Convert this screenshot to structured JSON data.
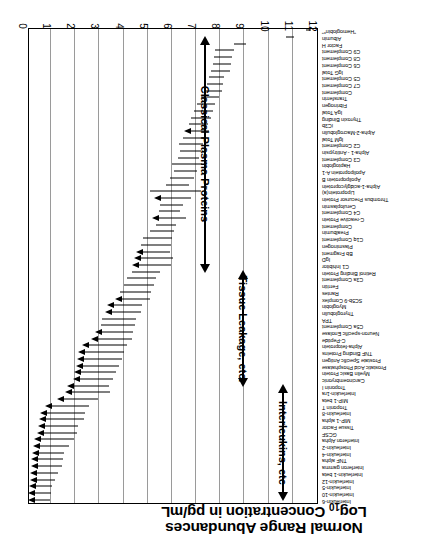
{
  "chart_data": {
    "type": "bar",
    "orientation": "horizontal-range",
    "title": "Normal Range Abundances",
    "title_line1": "Normal Range Abundances",
    "title_line2_pre": "Log",
    "title_line2_sub": "10",
    "title_line2_post": " Concentration in pg/mL",
    "xlabel": "Log10 Concentration in pg/mL",
    "ylabel": "",
    "xlim": [
      0,
      12
    ],
    "xticks": [
      0,
      1,
      2,
      3,
      4,
      5,
      6,
      7,
      8,
      9,
      10,
      11,
      12
    ],
    "xtick_labels": [
      "0",
      "1",
      "2",
      "3",
      "4",
      "5",
      "6",
      "7",
      "8",
      "9",
      "10",
      "11",
      "12"
    ],
    "grid": "vertical gridlines at every integer log unit",
    "legend": "none",
    "axis_note": "axis increases right-to-left in the printed (rotated) figure",
    "annotations": [
      {
        "label": "Interleukins, etc",
        "span_log10": [
          0.3,
          2.2
        ],
        "arrow": "double-headed"
      },
      {
        "label": "Tissue Leakage, etc.",
        "span_log10": [
          2.2,
          5.6
        ],
        "arrow": "double-headed"
      },
      {
        "label": "Classical Plasma Proteins",
        "span_log10": [
          5.6,
          11.6
        ],
        "arrow": "double-headed"
      }
    ],
    "value_unit": "log10 pg/mL",
    "series_description": "Each row is the normal plasma concentration range (low to high) of one protein; arrowheads mark the low-abundance end.",
    "rows": [
      {
        "name": "Interleukin-6",
        "low": 0.1,
        "high": 0.95,
        "arrow": true
      },
      {
        "name": "Interleukin-10",
        "low": 0.1,
        "high": 1.0,
        "arrow": true
      },
      {
        "name": "Interleukin-5",
        "low": 0.12,
        "high": 1.05,
        "arrow": true
      },
      {
        "name": "Interleukin-12",
        "low": 0.15,
        "high": 1.15,
        "arrow": true
      },
      {
        "name": "Interleukin-1 beta",
        "low": 0.18,
        "high": 1.3,
        "arrow": true
      },
      {
        "name": "Interferon gamma",
        "low": 0.2,
        "high": 1.45,
        "arrow": true
      },
      {
        "name": "TNF alpha",
        "low": 0.22,
        "high": 1.5,
        "arrow": true
      },
      {
        "name": "Interleukin-4",
        "low": 0.25,
        "high": 1.55,
        "arrow": true
      },
      {
        "name": "Interleukin-2",
        "low": 0.3,
        "high": 1.75,
        "arrow": true
      },
      {
        "name": "Interferon Alpha",
        "low": 0.35,
        "high": 1.95,
        "arrow": true
      },
      {
        "name": "GCSF",
        "low": 0.45,
        "high": 2.05,
        "arrow": true
      },
      {
        "name": "Tissue Factor",
        "low": 0.5,
        "high": 2.1,
        "arrow": true
      },
      {
        "name": "MIP-1 alpha",
        "low": 0.55,
        "high": 2.35,
        "arrow": true
      },
      {
        "name": "Interleukin-8",
        "low": 0.6,
        "high": 2.4,
        "arrow": true
      },
      {
        "name": "Troponin T",
        "low": 0.8,
        "high": 2.55,
        "arrow": true
      },
      {
        "name": "MIP-1 beta",
        "low": 1.3,
        "high": 2.95,
        "arrow": true
      },
      {
        "name": "Interleukin-1ra",
        "low": 1.6,
        "high": 3.45,
        "arrow": true
      },
      {
        "name": "Troponin I",
        "low": 1.7,
        "high": 3.4,
        "arrow": true
      },
      {
        "name": "Carcinoembryonic",
        "low": 1.95,
        "high": 3.55,
        "arrow": true
      },
      {
        "name": "Myelin Basic Protein",
        "low": 2.0,
        "high": 3.7,
        "arrow": true
      },
      {
        "name": "Prostatic Acid Phosphatase",
        "low": 2.05,
        "high": 3.8,
        "arrow": true
      },
      {
        "name": "Prostate Specific Antigen",
        "low": 2.1,
        "high": 3.95,
        "arrow": true
      },
      {
        "name": "TNF Binding Proteins",
        "low": 2.15,
        "high": 4.0,
        "arrow": true
      },
      {
        "name": "Alpha-fetoprotein",
        "low": 2.3,
        "high": 4.15,
        "arrow": true
      },
      {
        "name": "C-Peptide",
        "low": 2.7,
        "high": 4.35,
        "arrow": true
      },
      {
        "name": "Neuron-specific Enolase",
        "low": 2.85,
        "high": 4.4,
        "arrow": true
      },
      {
        "name": "C5a Complement",
        "low": 3.05,
        "high": 4.45,
        "arrow": false
      },
      {
        "name": "TPA",
        "low": 3.1,
        "high": 4.5,
        "arrow": false
      },
      {
        "name": "Thyroglobulin",
        "low": 3.25,
        "high": 4.7,
        "arrow": true
      },
      {
        "name": "Myoglobin",
        "low": 3.35,
        "high": 4.75,
        "arrow": true
      },
      {
        "name": "SC5b-9 Complex",
        "low": 3.7,
        "high": 5.1,
        "arrow": true
      },
      {
        "name": "Rantes",
        "low": 3.85,
        "high": 5.15,
        "arrow": false
      },
      {
        "name": "Ferritin",
        "low": 4.0,
        "high": 5.25,
        "arrow": false
      },
      {
        "name": "C3a Complement",
        "low": 4.15,
        "high": 5.35,
        "arrow": false
      },
      {
        "name": "Retinol Binding Protein",
        "low": 4.35,
        "high": 5.5,
        "arrow": false
      },
      {
        "name": "C1 Inhibitor",
        "low": 4.4,
        "high": 5.95,
        "arrow": true
      },
      {
        "name": "IgD",
        "low": 4.45,
        "high": 6.05,
        "arrow": true
      },
      {
        "name": "Bb Fragment",
        "low": 4.55,
        "high": 5.9,
        "arrow": true
      },
      {
        "name": "Plasminogen",
        "low": 4.7,
        "high": 5.95,
        "arrow": false
      },
      {
        "name": "C1q Complement",
        "low": 4.8,
        "high": 6.0,
        "arrow": false
      },
      {
        "name": "Prealbumin",
        "low": 5.1,
        "high": 6.1,
        "arrow": false
      },
      {
        "name": "Complement",
        "low": 5.35,
        "high": 6.15,
        "arrow": false
      },
      {
        "name": "C-reactive Protein",
        "low": 5.2,
        "high": 6.6,
        "arrow": true
      },
      {
        "name": "C4 Complement",
        "low": 5.45,
        "high": 6.35,
        "arrow": false
      },
      {
        "name": "Ceruloplasmin",
        "low": 5.5,
        "high": 6.45,
        "arrow": false
      },
      {
        "name": "Thrombus Precursor Protein",
        "low": 5.3,
        "high": 6.8,
        "arrow": true
      },
      {
        "name": "Lipoprotein(a)",
        "low": 5.1,
        "high": 7.2,
        "arrow": false
      },
      {
        "name": "Alpha-1-acidglycoprotein",
        "low": 5.75,
        "high": 6.7,
        "arrow": false
      },
      {
        "name": "Apolipoprotein B",
        "low": 5.9,
        "high": 6.9,
        "arrow": false
      },
      {
        "name": "Apolipoprotein A-1",
        "low": 6.1,
        "high": 7.05,
        "arrow": false
      },
      {
        "name": "Haptoglobin",
        "low": 6.0,
        "high": 7.25,
        "arrow": false
      },
      {
        "name": "C3 Complement",
        "low": 6.25,
        "high": 7.1,
        "arrow": false
      },
      {
        "name": "Alpha-1 - Antitrypsin",
        "low": 6.35,
        "high": 7.2,
        "arrow": false
      },
      {
        "name": "C2 Complement",
        "low": 6.3,
        "high": 7.3,
        "arrow": false
      },
      {
        "name": "IgM Total",
        "low": 6.45,
        "high": 7.4,
        "arrow": false
      },
      {
        "name": "Alpha-2-Macroglobulin",
        "low": 6.55,
        "high": 7.55,
        "arrow": true
      },
      {
        "name": "iC3b",
        "low": 6.7,
        "high": 7.5,
        "arrow": false
      },
      {
        "name": "Thyroxin Binding",
        "low": 6.8,
        "high": 7.6,
        "arrow": false
      },
      {
        "name": "IgA Total",
        "low": 6.9,
        "high": 7.7,
        "arrow": false
      },
      {
        "name": "Fibrinogen",
        "low": 7.05,
        "high": 7.8,
        "arrow": false
      },
      {
        "name": "Transferrin",
        "low": 7.2,
        "high": 7.95,
        "arrow": false
      },
      {
        "name": "Complement",
        "low": 7.35,
        "high": 8.05,
        "arrow": false
      },
      {
        "name": "C7 Complement",
        "low": 7.45,
        "high": 8.1,
        "arrow": false
      },
      {
        "name": "C5 Complement",
        "low": 7.55,
        "high": 8.15,
        "arrow": false
      },
      {
        "name": "IgG Total",
        "low": 7.6,
        "high": 8.4,
        "arrow": false
      },
      {
        "name": "C6 Complement",
        "low": 7.7,
        "high": 8.45,
        "arrow": false
      },
      {
        "name": "C8 Complement",
        "low": 7.75,
        "high": 8.5,
        "arrow": false
      },
      {
        "name": "C9 Complement",
        "low": 7.8,
        "high": 8.55,
        "arrow": false
      },
      {
        "name": "Factor H",
        "low": 8.55,
        "high": 9.05,
        "arrow": false
      },
      {
        "name": "Albumin",
        "low": 10.7,
        "high": 11.05,
        "arrow": false
      },
      {
        "name": "\"Hemoglobin*\"",
        "low": 11.55,
        "high": 11.75,
        "arrow": false
      }
    ]
  }
}
